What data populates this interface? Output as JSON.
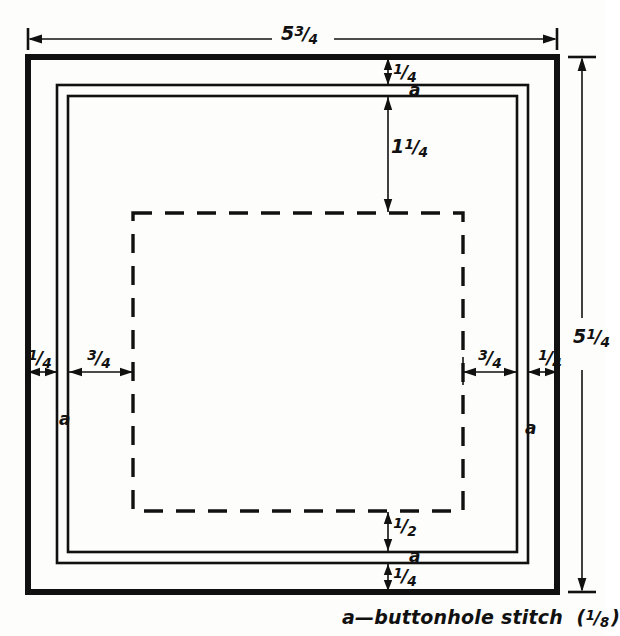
{
  "drawing": {
    "title": "Square doily / mat construction diagram",
    "units_note": "inches",
    "colors": {
      "ink": "#111111",
      "paper": "#fdfdfb"
    },
    "dimensions": {
      "overall_width": {
        "whole": "5",
        "num": "3",
        "den": "4",
        "text": "5 3/4",
        "position": "top"
      },
      "overall_height": {
        "whole": "5",
        "num": "1",
        "den": "4",
        "text": "5 1/4",
        "position": "right"
      },
      "top_border": {
        "whole": "",
        "num": "1",
        "den": "4",
        "text": "1/4"
      },
      "top_inner_offset": {
        "whole": "1",
        "num": "1",
        "den": "4",
        "text": "1 1/4"
      },
      "left_border": {
        "whole": "",
        "num": "1",
        "den": "4",
        "text": "1/4"
      },
      "left_inner_offset": {
        "whole": "",
        "num": "3",
        "den": "4",
        "text": "3/4"
      },
      "right_inner_offset": {
        "whole": "",
        "num": "3",
        "den": "4",
        "text": "3/4"
      },
      "right_border": {
        "whole": "",
        "num": "1",
        "den": "4",
        "text": "1/4"
      },
      "bottom_inner_offset": {
        "whole": "",
        "num": "1",
        "den": "2",
        "text": "1/2"
      },
      "bottom_border": {
        "whole": "",
        "num": "1",
        "den": "4",
        "text": "1/4"
      }
    },
    "stitch_marks": {
      "label": "a",
      "positions": [
        "top",
        "left",
        "right",
        "bottom"
      ]
    },
    "caption": {
      "key": "a",
      "dash": "—",
      "text": "buttonhole stitch",
      "open_paren": "(",
      "frac_num": "1",
      "frac_den": "8",
      "close_paren": ")",
      "full": "a—buttonhole stitch (1/8)"
    }
  }
}
